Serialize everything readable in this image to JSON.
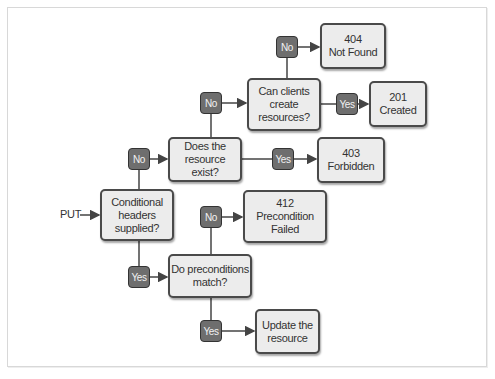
{
  "diagram": {
    "entry_label": "PUT",
    "colors": {
      "box_fill": "#ececec",
      "box_border": "#4a4a4a",
      "pill_fill": "#6e6e6e",
      "pill_text": "#f2f2f2",
      "line": "#444444"
    },
    "decisions": {
      "conditional_headers": "Conditional\nheaders\nsupplied?",
      "resource_exists": "Does the\nresource exist?",
      "clients_create": "Can clients\ncreate\nresources?",
      "preconditions_match": "Do preconditions\nmatch?"
    },
    "outcomes": {
      "not_found": "404\nNot Found",
      "created": "201\nCreated",
      "forbidden": "403\nForbidden",
      "precondition_failed": "412\nPrecondition\nFailed",
      "update": "Update the\nresource"
    },
    "branches": {
      "no": "No",
      "yes": "Yes"
    }
  }
}
